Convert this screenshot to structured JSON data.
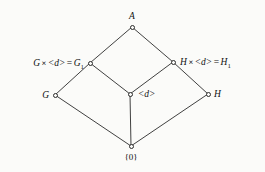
{
  "figure": {
    "kind": "hasse-lattice-diagram",
    "width": 265,
    "height": 172,
    "background_color": "#fbfbf9",
    "edge_color": "#2b2b2b",
    "node_fill_color": "#fbfbf9",
    "text_color": "#111111"
  },
  "nodes": {
    "top": {
      "id": "A",
      "label": "A",
      "x": 132,
      "y": 27,
      "level": 0
    },
    "left_upper": {
      "id": "G1",
      "label_parts": {
        "first": "G",
        "operator": "×",
        "open_angle": "<",
        "generator": "d",
        "close_angle": ">",
        "equals": "=",
        "result_base": "G",
        "result_subscript": "1"
      },
      "label_plain": "G × < d > = G₁",
      "x": 90,
      "y": 63,
      "level": 1
    },
    "right_upper": {
      "id": "H1",
      "label_parts": {
        "first": "H",
        "operator": "×",
        "open_angle": "<",
        "generator": "d",
        "close_angle": ">",
        "equals": "=",
        "result_base": "H",
        "result_subscript": "1"
      },
      "label_plain": "H × < d > = H₁",
      "x": 173,
      "y": 62,
      "level": 1
    },
    "left_lower": {
      "id": "G",
      "label": "G",
      "x": 55,
      "y": 95,
      "level": 2
    },
    "center": {
      "id": "d",
      "label_parts": {
        "open_angle": "<",
        "generator": "d",
        "close_angle": ">"
      },
      "label_plain": "< d >",
      "x": 130,
      "y": 94,
      "level": 2
    },
    "right_lower": {
      "id": "H",
      "label": "H",
      "x": 208,
      "y": 94,
      "level": 2
    },
    "bottom": {
      "id": "zero",
      "label": "{0}",
      "x": 131,
      "y": 146,
      "level": 3
    }
  },
  "edges": [
    {
      "from": "A",
      "to": "G1",
      "x1": 132,
      "y1": 27,
      "x2": 90,
      "y2": 63
    },
    {
      "from": "A",
      "to": "H1",
      "x1": 132,
      "y1": 27,
      "x2": 173,
      "y2": 62
    },
    {
      "from": "G1",
      "to": "G",
      "x1": 90,
      "y1": 63,
      "x2": 55,
      "y2": 95
    },
    {
      "from": "G1",
      "to": "d",
      "x1": 90,
      "y1": 63,
      "x2": 130,
      "y2": 94
    },
    {
      "from": "H1",
      "to": "d",
      "x1": 173,
      "y1": 62,
      "x2": 130,
      "y2": 94
    },
    {
      "from": "H1",
      "to": "H",
      "x1": 173,
      "y1": 62,
      "x2": 208,
      "y2": 94
    },
    {
      "from": "G",
      "to": "zero",
      "x1": 55,
      "y1": 95,
      "x2": 131,
      "y2": 146
    },
    {
      "from": "d",
      "to": "zero",
      "x1": 130,
      "y1": 94,
      "x2": 131,
      "y2": 146
    },
    {
      "from": "H",
      "to": "zero",
      "x1": 208,
      "y1": 94,
      "x2": 131,
      "y2": 146
    }
  ]
}
